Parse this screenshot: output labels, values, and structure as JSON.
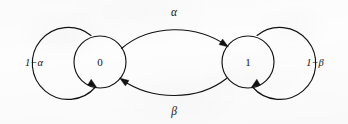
{
  "figure": {
    "kind": "state-transition-diagram",
    "background_color": "#fdfdfd",
    "ink_color": "#121212",
    "width": 348,
    "height": 124
  },
  "states": [
    {
      "id": "state-0",
      "label": "0",
      "cx": 100,
      "cy": 62,
      "r": 26
    },
    {
      "id": "state-1",
      "label": "1",
      "cx": 248,
      "cy": 62,
      "r": 26
    }
  ],
  "self_loops": [
    {
      "id": "self-loop-0",
      "label": "1−α",
      "from": "0",
      "to": "0",
      "side": "left",
      "cx": 62,
      "cy": 62,
      "r": 36,
      "label_x": 34,
      "label_y": 64
    },
    {
      "id": "self-loop-1",
      "label": "1−β",
      "from": "1",
      "to": "1",
      "side": "right",
      "cx": 286,
      "cy": 62,
      "r": 36,
      "label_x": 315,
      "label_y": 64
    }
  ],
  "transitions": [
    {
      "id": "transition-0-to-1",
      "label": "α",
      "from": "0",
      "to": "1",
      "arc": "top",
      "label_x": 174,
      "label_y": 13
    },
    {
      "id": "transition-1-to-0",
      "label": "β",
      "from": "1",
      "to": "0",
      "arc": "bottom",
      "label_x": 174,
      "label_y": 112
    }
  ]
}
